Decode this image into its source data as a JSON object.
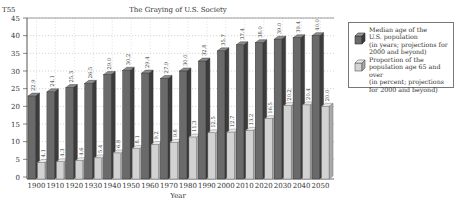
{
  "chart_data": {
    "type": "bar",
    "title": "The Graying of U.S. Society",
    "corner_label": "T55",
    "xlabel": "Year",
    "ylabel": "",
    "ylim": [
      0,
      45
    ],
    "yticks": [
      0,
      5,
      10,
      15,
      20,
      25,
      30,
      35,
      40,
      45
    ],
    "grid": true,
    "legend_position": "right",
    "categories": [
      "1900",
      "1910",
      "1920",
      "1930",
      "1940",
      "1950",
      "1960",
      "1970",
      "1980",
      "1990",
      "2000",
      "2010",
      "2020",
      "2030",
      "2040",
      "2050"
    ],
    "series": [
      {
        "name": "Median age of the U.S. population (in years; projections for 2000 and beyond)",
        "color": "#6a6a6a",
        "values": [
          22.9,
          24.1,
          25.3,
          26.5,
          29.0,
          30.2,
          29.4,
          27.9,
          30.0,
          32.8,
          35.7,
          37.4,
          38.0,
          39.0,
          39.4,
          40.0
        ]
      },
      {
        "name": "Proportion of the population age 65 and over (in percent; projections for 2000 and beyond)",
        "color": "#cfcfcf",
        "values": [
          4.1,
          4.3,
          4.6,
          5.4,
          6.8,
          8.1,
          9.2,
          9.8,
          11.3,
          12.5,
          12.7,
          13.2,
          16.5,
          20.2,
          20.4,
          20.0
        ]
      }
    ]
  },
  "legend": {
    "items": [
      {
        "lines": [
          "Median age of the",
          "U.S. population",
          "(in years; projections for",
          "2000 and beyond)"
        ]
      },
      {
        "lines": [
          "Proportion of the",
          "population age 65 and over",
          "(in percent; projections",
          "for 2000 and beyond)"
        ]
      }
    ]
  }
}
